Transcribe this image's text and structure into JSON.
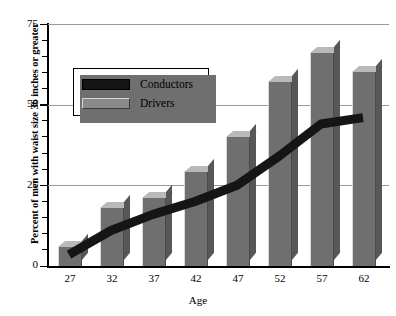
{
  "chart_data": {
    "type": "bar",
    "title": "",
    "xlabel": "Age",
    "ylabel": "Percent of men with waist size 36 inches or greater",
    "categories": [
      "27",
      "32",
      "37",
      "42",
      "47",
      "52",
      "57",
      "62"
    ],
    "ylim": [
      0,
      75
    ],
    "yticks": [
      0,
      25,
      50,
      75
    ],
    "ytick_labels": [
      "0",
      "25",
      "50",
      "75"
    ],
    "minor_tick_interval": 5,
    "grid": "horizontal",
    "legend_position": "upper-left-inset",
    "series": [
      {
        "name": "Conductors",
        "type": "line",
        "color": "#151515",
        "values": [
          3.5,
          11,
          16,
          20,
          25,
          34,
          44,
          46
        ]
      },
      {
        "name": "Drivers",
        "type": "bar",
        "color": "#6f6f6f",
        "values": [
          6,
          18,
          21,
          29,
          40,
          57,
          66,
          60
        ]
      }
    ]
  },
  "legend": {
    "items": [
      {
        "label": "Conductors",
        "swatch": "black-bar-swatch"
      },
      {
        "label": "Drivers",
        "swatch": "gray-bar-swatch"
      }
    ]
  },
  "axes": {
    "x_title": "Age",
    "y_title": "Percent of men with waist size 36 inches or greater",
    "y_labels": [
      "75",
      "50",
      "25",
      "0"
    ],
    "x_labels": [
      "27",
      "32",
      "37",
      "42",
      "47",
      "52",
      "57",
      "62"
    ]
  },
  "colors": {
    "bar_front": "#6f6f6f",
    "bar_top": "#b9b9b9",
    "bar_side": "#575757",
    "line": "#151515",
    "gridline": "#9a9a9a",
    "axis": "#000000",
    "background": "#ffffff"
  }
}
